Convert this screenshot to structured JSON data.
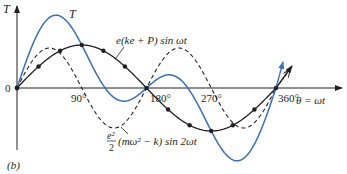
{
  "figure": {
    "panel_label": "(b)",
    "y_axis_label": "T",
    "x_axis_label": "θ = ωt",
    "origin_label": "0",
    "x_ticks": [
      {
        "label": "90°",
        "deg": 90
      },
      {
        "label": "180°",
        "deg": 180
      },
      {
        "label": "270°",
        "deg": 270
      },
      {
        "label": "360°",
        "deg": 360
      }
    ],
    "curve_labels": {
      "total": "T",
      "first": "e(ke + P) sin ωt",
      "second_coef_num": "e²",
      "second_coef_den": "2",
      "second_rest": "(mω² − k) sin 2ωt"
    },
    "colors": {
      "total": "#3b6fb6",
      "first": "#231f20",
      "second": "#231f20",
      "axis": "#231f20"
    }
  },
  "chart_data": {
    "type": "line",
    "title": "",
    "xlabel": "θ = ωt",
    "ylabel": "T",
    "x_range_deg": [
      0,
      360
    ],
    "x_ticks": [
      "90°",
      "180°",
      "270°",
      "360°"
    ],
    "series": [
      {
        "name": "T",
        "style": "solid blue",
        "formula": "A sin θ + B sin 2θ",
        "relative_amplitude_peak": 1.0
      },
      {
        "name": "e(ke + P) sin ωt",
        "style": "solid black with dots every 30°",
        "formula": "A sin θ",
        "relative_amplitude": 0.6
      },
      {
        "name": "e²/2 (mω² − k) sin 2ωt",
        "style": "dashed black",
        "formula": "B sin 2θ",
        "relative_amplitude": 0.56
      }
    ],
    "grid": false,
    "legend": "inline labels"
  }
}
